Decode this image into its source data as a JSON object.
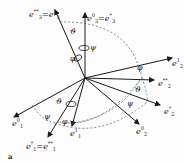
{
  "figure": {
    "panel_label": "a",
    "axes": [
      {
        "id": "e3_top_left",
        "text": "e₃** = e₃¹",
        "base": "e",
        "sub": "3",
        "sup": "**",
        "eq_sup": "1"
      },
      {
        "id": "e3_top",
        "text": "e₃⁰ = e₃*",
        "base": "e",
        "sub": "3",
        "sup": "0",
        "eq_sup": "*"
      },
      {
        "id": "e2_1",
        "text": "e₂¹",
        "base": "e",
        "sub": "2",
        "sup": "1"
      },
      {
        "id": "e2_ss",
        "text": "e₂**",
        "base": "e",
        "sub": "2",
        "sup": "**"
      },
      {
        "id": "e2_s",
        "text": "e₂*",
        "base": "e",
        "sub": "2",
        "sup": "*"
      },
      {
        "id": "e2_0",
        "text": "e₂⁰",
        "base": "e",
        "sub": "2",
        "sup": "0"
      },
      {
        "id": "e1_0",
        "text": "e₁⁰",
        "base": "e",
        "sub": "1",
        "sup": "0"
      },
      {
        "id": "e1_s",
        "text": "e₁* = e₁**",
        "base": "e",
        "sub": "1",
        "sup": "*",
        "eq_sup": "**"
      },
      {
        "id": "e1_1",
        "text": "e₁¹",
        "base": "e",
        "sub": "1",
        "sup": "1"
      }
    ],
    "angles": {
      "theta": "ϑ",
      "psi": "ψ",
      "phi": "φ"
    },
    "colors": {
      "line": "#1a1a1a",
      "dashed": "#555555",
      "background": "#fdfdfd"
    }
  }
}
